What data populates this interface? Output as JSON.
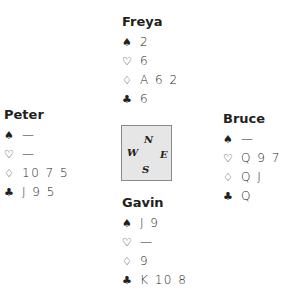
{
  "suit_symbols": {
    "spades": "♠",
    "hearts": "♡",
    "diamonds": "♢",
    "clubs": "♣"
  },
  "hands": {
    "north": {
      "name": "Freya",
      "spades": "2",
      "hearts": "6",
      "diamonds": "A 6 2",
      "clubs": "6"
    },
    "west": {
      "name": "Peter",
      "spades": "—",
      "hearts": "—",
      "diamonds": "10 7 5",
      "clubs": "J 9 5"
    },
    "east": {
      "name": "Bruce",
      "spades": "—",
      "hearts": "Q 9 7",
      "diamonds": "Q J",
      "clubs": "Q"
    },
    "south": {
      "name": "Gavin",
      "spades": "J 9",
      "hearts": "—",
      "diamonds": "9",
      "clubs": "K 10 8"
    }
  },
  "compass": {
    "n": "N",
    "w": "W",
    "e": "E",
    "s": "S",
    "background": "#e6e6e6"
  }
}
